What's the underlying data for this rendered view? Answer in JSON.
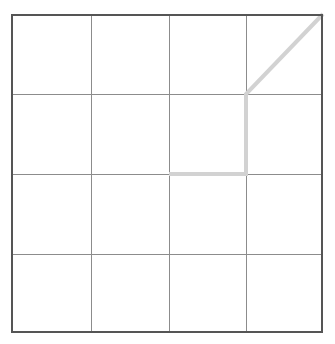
{
  "figure": {
    "name": "grid-with-highlighted-path",
    "width": 335,
    "height": 344,
    "background_color": "#ffffff"
  },
  "grid": {
    "rows": 4,
    "columns": 4,
    "x_lines": [
      11,
      91,
      169,
      246,
      323
    ],
    "y_lines": [
      14,
      94,
      174,
      254,
      333
    ],
    "left": 11,
    "top": 14,
    "right": 323,
    "bottom": 333,
    "cell_width": 78,
    "cell_height": 79.75,
    "border_color": "#555555",
    "border_width": 2,
    "line_color": "#8c8c8c",
    "line_width": 1,
    "cell_fill": "#ffffff"
  },
  "path": {
    "color": "#d2d2d2",
    "width": 4,
    "linecap": "butt",
    "description": "diagonal then vertical then horizontal",
    "points": [
      {
        "x": 323,
        "y": 14
      },
      {
        "x": 246,
        "y": 94
      },
      {
        "x": 246,
        "y": 174
      },
      {
        "x": 169,
        "y": 174
      }
    ],
    "segments": [
      {
        "name": "diagonal-segment",
        "x1": 323,
        "y1": 14,
        "x2": 246,
        "y2": 94
      },
      {
        "name": "vertical-segment",
        "x1": 246,
        "y1": 94,
        "x2": 246,
        "y2": 174
      },
      {
        "name": "horizontal-segment",
        "x1": 246,
        "y1": 174,
        "x2": 169,
        "y2": 174
      }
    ]
  },
  "chart_data": {
    "type": "line",
    "title": "",
    "xlabel": "",
    "ylabel": "",
    "grid": true,
    "legend": "none",
    "xlim": [
      0,
      4
    ],
    "ylim": [
      0,
      4
    ],
    "xticks": [
      0,
      1,
      2,
      3,
      4
    ],
    "yticks": [
      0,
      4,
      3,
      2,
      1
    ],
    "xtick_labels": [
      "",
      "",
      "",
      "",
      ""
    ],
    "ytick_labels": [
      "",
      "",
      "",
      "",
      ""
    ],
    "series": [
      {
        "name": "path",
        "color": "#d2d2d2",
        "linewidth": 4,
        "x": [
          4,
          3,
          3,
          2
        ],
        "y": [
          4,
          3,
          2,
          2
        ]
      }
    ]
  }
}
